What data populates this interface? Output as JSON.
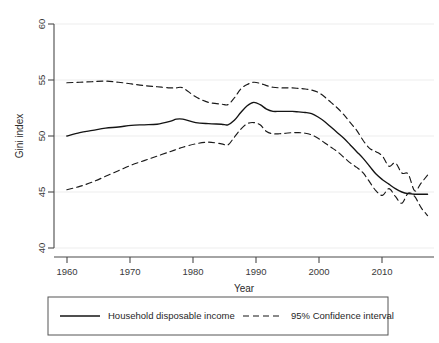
{
  "chart_data": {
    "type": "line",
    "title": "",
    "xlabel": "Year",
    "ylabel": "Gini index",
    "xlim": [
      1958,
      2017
    ],
    "ylim": [
      40,
      60
    ],
    "xticks": [
      1960,
      1970,
      1980,
      1990,
      2000,
      2010
    ],
    "xtick_labels": [
      "1960",
      "1970",
      "1980",
      "1990",
      "2000",
      "2010"
    ],
    "yticks": [
      40,
      45,
      50,
      55,
      60
    ],
    "ytick_labels": [
      "40",
      "45",
      "50",
      "55",
      "60"
    ],
    "grid": "horizontal",
    "grid_color": "#e9e9e9",
    "legend_position": "below",
    "line_color": "#1a1a1a",
    "x": [
      1960,
      1962,
      1964,
      1966,
      1968,
      1970,
      1972,
      1974,
      1976,
      1977,
      1978,
      1980,
      1982,
      1984,
      1985,
      1986,
      1987,
      1988,
      1989,
      1990,
      1991,
      1992,
      1993,
      1994,
      1995,
      1996,
      1997,
      1998,
      1999,
      2000,
      2001,
      2002,
      2003,
      2004,
      2005,
      2006,
      2007,
      2008,
      2009,
      2010,
      2011,
      2012,
      2013,
      2014,
      2015,
      2016
    ],
    "series": [
      {
        "name": "Household disposable income",
        "style": "solid",
        "values": [
          50.0,
          50.3,
          50.5,
          50.7,
          50.8,
          50.95,
          51.0,
          51.05,
          51.3,
          51.5,
          51.5,
          51.2,
          51.1,
          51.05,
          51.0,
          51.4,
          52.1,
          52.7,
          53.0,
          52.8,
          52.4,
          52.2,
          52.2,
          52.2,
          52.2,
          52.15,
          52.1,
          52.0,
          51.7,
          51.3,
          50.8,
          50.3,
          49.8,
          49.2,
          48.6,
          48.0,
          47.3,
          46.6,
          46.1,
          45.7,
          45.3,
          45.0,
          44.85,
          44.8,
          44.8,
          44.8
        ]
      },
      {
        "name": "95% Confidence interval upper",
        "style": "dashed",
        "values": [
          54.75,
          54.8,
          54.85,
          54.9,
          54.8,
          54.65,
          54.5,
          54.4,
          54.3,
          54.3,
          54.3,
          53.5,
          53.0,
          52.85,
          52.8,
          53.4,
          54.2,
          54.6,
          54.8,
          54.7,
          54.5,
          54.35,
          54.3,
          54.3,
          54.3,
          54.25,
          54.2,
          54.1,
          53.9,
          53.5,
          53.0,
          52.5,
          51.9,
          51.2,
          50.5,
          49.6,
          48.9,
          48.6,
          48.2,
          47.3,
          47.6,
          46.7,
          46.6,
          45.1,
          45.8,
          46.5
        ]
      },
      {
        "name": "95% Confidence interval lower",
        "style": "dashed",
        "values": [
          45.2,
          45.5,
          45.9,
          46.4,
          46.9,
          47.4,
          47.8,
          48.2,
          48.6,
          48.8,
          49.0,
          49.3,
          49.45,
          49.3,
          49.2,
          49.9,
          50.6,
          51.1,
          51.2,
          51.0,
          50.4,
          50.2,
          50.2,
          50.25,
          50.3,
          50.3,
          50.25,
          50.1,
          49.8,
          49.4,
          49.0,
          48.6,
          48.1,
          47.6,
          47.2,
          46.7,
          45.9,
          45.1,
          44.7,
          45.3,
          44.6,
          44.0,
          44.9,
          44.6,
          43.6,
          42.9
        ]
      }
    ]
  },
  "axes": {
    "y_title": "Gini index",
    "x_title": "Year",
    "y_labels": [
      "60",
      "55",
      "50",
      "45",
      "40"
    ],
    "x_labels": [
      "1960",
      "1970",
      "1980",
      "1990",
      "2000",
      "2010"
    ]
  },
  "legend": {
    "items": [
      {
        "label": "Household disposable income",
        "style": "solid"
      },
      {
        "label": "95% Confidence interval",
        "style": "dashed"
      }
    ]
  }
}
